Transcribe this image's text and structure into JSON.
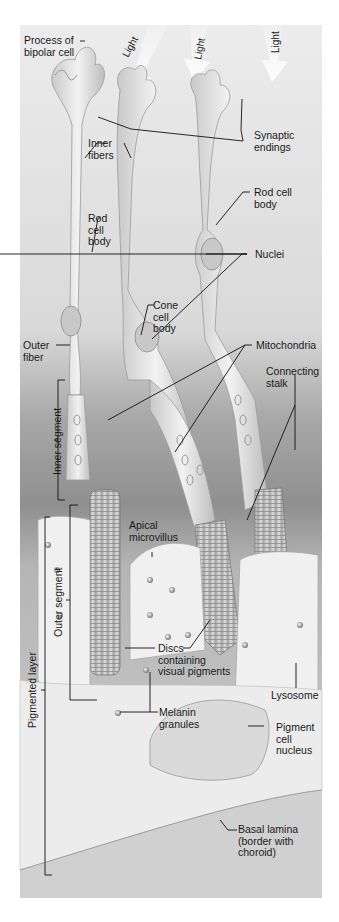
{
  "figure": {
    "colors": {
      "background": "#ffffff",
      "panel": "#e8e8e8",
      "dark_band": "#8e8e8e",
      "cell_fill": "#dcdcdc",
      "cell_outline": "#9a9a9a",
      "pigment_cell": "#efefef",
      "leader_line": "#111111",
      "label_text": "#1a1a1a"
    }
  },
  "light_arrows": [
    {
      "label": "Light"
    },
    {
      "label": "Light"
    },
    {
      "label": "Light"
    }
  ],
  "labels": {
    "process_bipolar": "Process of\nbipolar cell",
    "synaptic_endings": "Synaptic\nendings",
    "inner_fibers": "Inner\nfibers",
    "rod_cell_body_left": "Rod\ncell\nbody",
    "rod_cell_body_right": "Rod cell\nbody",
    "nuclei": "Nuclei",
    "cone_cell_body": "Cone\ncell\nbody",
    "outer_fiber": "Outer\nfiber",
    "mitochondria": "Mitochondria",
    "connecting_stalk": "Connecting\nstalk",
    "inner_segment": "Inner segment",
    "apical_microvillus": "Apical\nmicrovillus",
    "outer_segment": "Outer segment",
    "discs": "Discs\ncontaining\nvisual pigments",
    "lysosome": "Lysosome",
    "pigmented_layer": "Pigmented layer",
    "melanin_granules": "Melanin\ngranules",
    "pigment_cell_nucleus": "Pigment\ncell\nnucleus",
    "basal_lamina": "Basal lamina\n(border with\nchoroid)"
  }
}
